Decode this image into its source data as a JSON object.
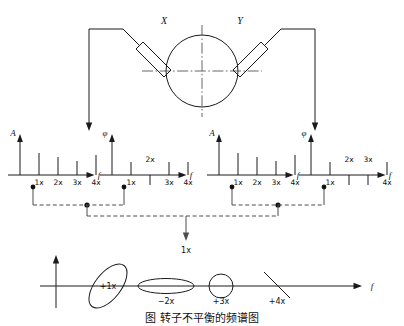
{
  "figure": {
    "title_caption": "图  转子不平衡的频谱图",
    "rotor": {
      "probe_x_label": "X",
      "probe_y_label": "Y",
      "centerline_style": "dash-dot"
    },
    "signal_arrow_labels": [
      "X",
      "Y"
    ],
    "combine_label": "1x",
    "axis_symbols": {
      "amplitude": "A",
      "phase": "φ",
      "frequency": "f"
    },
    "spectra": [
      {
        "id": "x-amplitude",
        "axis_y_label": "A",
        "axis_x_label": "f",
        "ticks": [
          "1x",
          "2x",
          "3x",
          "4x"
        ],
        "tick_direction": [
          "up",
          "up",
          "up",
          "up"
        ],
        "label_side": [
          "below",
          "below",
          "below",
          "below"
        ],
        "heights": [
          22,
          18,
          14,
          20
        ]
      },
      {
        "id": "x-phase",
        "axis_y_label": "φ",
        "axis_x_label": "f",
        "ticks": [
          "1x",
          "2x",
          "3x",
          "4x"
        ],
        "tick_direction": [
          "up",
          "down",
          "up",
          "up"
        ],
        "label_side": [
          "below",
          "above",
          "below",
          "below"
        ],
        "heights": [
          13,
          10,
          13,
          13
        ]
      },
      {
        "id": "y-amplitude",
        "axis_y_label": "A",
        "axis_x_label": "f",
        "ticks": [
          "1x",
          "2x",
          "3x",
          "4x"
        ],
        "tick_direction": [
          "up",
          "up",
          "up",
          "up"
        ],
        "label_side": [
          "below",
          "below",
          "below",
          "below"
        ],
        "heights": [
          22,
          18,
          14,
          20
        ]
      },
      {
        "id": "y-phase",
        "axis_y_label": "φ",
        "axis_x_label": "f",
        "ticks": [
          "1x",
          "2x",
          "3x",
          "4x"
        ],
        "tick_direction": [
          "up",
          "down",
          "down",
          "up"
        ],
        "label_side": [
          "below",
          "above",
          "above",
          "below"
        ],
        "heights": [
          13,
          10,
          10,
          13
        ]
      }
    ],
    "orbit_plot": {
      "axis_x_label": "f",
      "orbits": [
        {
          "label": "+1x",
          "shape": "tilted-ellipse"
        },
        {
          "label": "−2x",
          "shape": "flat-ellipse"
        },
        {
          "label": "+3x",
          "shape": "circle"
        },
        {
          "label": "+4x",
          "shape": "line"
        }
      ]
    },
    "colors": {
      "line": "#1a1a1a",
      "dashed": "#4d4d4d",
      "background": "#ffffff"
    }
  }
}
